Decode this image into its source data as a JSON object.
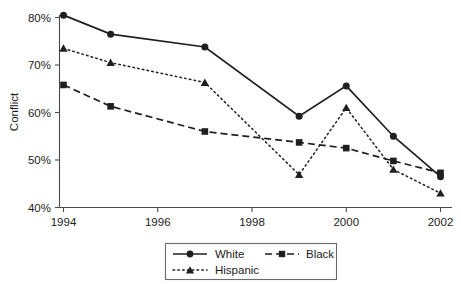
{
  "chart_data": {
    "type": "line",
    "title": "",
    "xlabel": "",
    "ylabel": "Conflict",
    "x": [
      1994,
      1995,
      1997,
      1999,
      2000,
      2001,
      2002
    ],
    "xlim": [
      1994,
      2002
    ],
    "ylim": [
      40,
      80
    ],
    "xticks": [
      "1994",
      "1996",
      "1998",
      "2000",
      "2002"
    ],
    "xtick_values": [
      1994,
      1996,
      1998,
      2000,
      2002
    ],
    "yticks": [
      "40%",
      "50%",
      "60%",
      "70%",
      "80%"
    ],
    "ytick_values": [
      40,
      50,
      60,
      70,
      80
    ],
    "grid": false,
    "legend_position": "below-center",
    "series": [
      {
        "name": "White",
        "marker": "circle",
        "linestyle": "solid",
        "color": "#1f1f1f",
        "values": [
          80.5,
          76.5,
          73.8,
          59.2,
          65.6,
          55.0,
          46.5
        ]
      },
      {
        "name": "Black",
        "marker": "square",
        "linestyle": "dashed",
        "color": "#1f1f1f",
        "values": [
          65.8,
          61.3,
          56.0,
          53.7,
          52.5,
          49.8,
          47.3
        ]
      },
      {
        "name": "Hispanic",
        "marker": "triangle",
        "linestyle": "dotted",
        "color": "#1f1f1f",
        "values": [
          73.5,
          70.5,
          66.3,
          46.9,
          61.0,
          48.0,
          43.0
        ]
      }
    ]
  },
  "axis": {
    "y_title": "Conflict"
  },
  "legend": {
    "entries": [
      {
        "label": "White"
      },
      {
        "label": "Black"
      },
      {
        "label": "Hispanic"
      }
    ]
  }
}
